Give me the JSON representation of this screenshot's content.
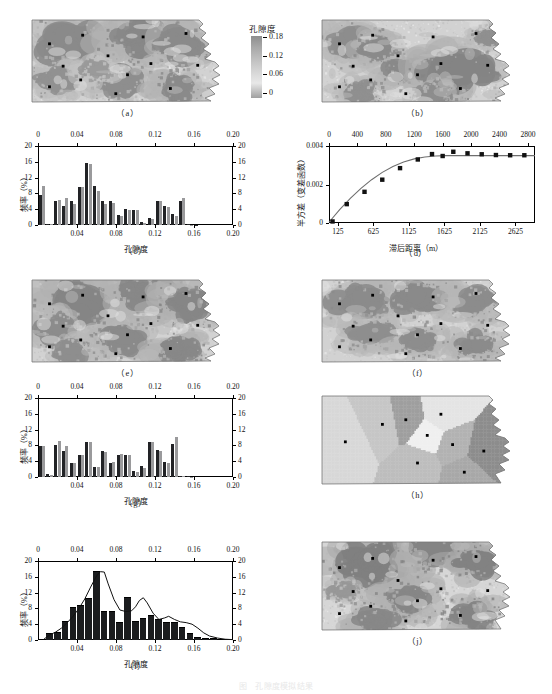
{
  "figure": {
    "caption": "图　孔隙度模拟结果",
    "colorbar": {
      "title": "孔隙度",
      "labels": [
        "0.18",
        "0.12",
        "0.06",
        "0"
      ],
      "values": [
        0.18,
        0.12,
        0.06,
        0
      ]
    },
    "panel_labels": {
      "a": "（a）",
      "b": "（b）",
      "c": "（c）",
      "d": "（d）",
      "e": "（e）",
      "f": "（f）",
      "g": "（g）",
      "h": "（h）",
      "i": "（i）",
      "j": "（j）"
    }
  },
  "chart_data": [
    {
      "id": "c",
      "type": "bar",
      "title": "（c）",
      "xlabel": "孔隙度",
      "ylabel": "频率（%）",
      "xlim": [
        0,
        0.2
      ],
      "ylim": [
        0,
        20
      ],
      "xticks_bottom": [
        "0.04",
        "0.08",
        "0.12",
        "0.16",
        "0.20"
      ],
      "xticks_top": [
        "0",
        "0.04",
        "0.08",
        "0.12",
        "0.16",
        "0.20"
      ],
      "yticks": [
        "0",
        "4",
        "8",
        "12",
        "16",
        "20"
      ],
      "grid": false,
      "legend": "none",
      "bin_width": 0.008,
      "categories": [
        0.004,
        0.012,
        0.02,
        0.028,
        0.036,
        0.044,
        0.052,
        0.06,
        0.068,
        0.076,
        0.084,
        0.092,
        0.1,
        0.108,
        0.116,
        0.124,
        0.132,
        0.14,
        0.148,
        0.156,
        0.164,
        0.172,
        0.18,
        0.188,
        0.196
      ],
      "series": [
        {
          "name": "模拟",
          "color": "#222326",
          "values": [
            7.6,
            0.3,
            6.2,
            4.7,
            6.0,
            9.5,
            15.8,
            9.8,
            6.0,
            6.0,
            2.6,
            4.0,
            3.9,
            0.8,
            1.8,
            6.0,
            4.7,
            2.9,
            6.0,
            0.2,
            0.1,
            0,
            0,
            0,
            0
          ]
        },
        {
          "name": "实测",
          "color": "#9a9a9c",
          "values": [
            10.0,
            0.2,
            6.3,
            6.8,
            5.2,
            9.6,
            15.5,
            8.5,
            5.4,
            5.6,
            2.4,
            3.8,
            3.8,
            0.6,
            1.5,
            6.2,
            4.6,
            2.4,
            6.9,
            0.1,
            0,
            0,
            0,
            0,
            0
          ]
        }
      ]
    },
    {
      "id": "d",
      "type": "line",
      "title": "（d）",
      "xlabel": "滞后距离（m）",
      "ylabel": "半方差（变差函数）",
      "xlim": [
        0,
        2900
      ],
      "ylim": [
        0,
        0.004
      ],
      "xticks_bottom": [
        "125",
        "625",
        "1125",
        "1625",
        "2125",
        "2625"
      ],
      "xticks_top": [
        "0",
        "400",
        "800",
        "1200",
        "1600",
        "2000",
        "2400",
        "2800"
      ],
      "yticks": [
        "0",
        "0.002",
        "0.004"
      ],
      "grid": false,
      "legend": "none",
      "points_x": [
        50,
        250,
        500,
        750,
        1000,
        1250,
        1450,
        1600,
        1750,
        1950,
        2150,
        2350,
        2550,
        2750
      ],
      "points_y": [
        8e-05,
        0.00098,
        0.00162,
        0.00225,
        0.00285,
        0.0033,
        0.00358,
        0.00348,
        0.0037,
        0.00362,
        0.00357,
        0.00353,
        0.00352,
        0.00352
      ],
      "model_name": "球状模型",
      "model_x": [
        0,
        150,
        300,
        450,
        600,
        750,
        900,
        1050,
        1200,
        1350,
        1500,
        1650,
        1800,
        2000,
        2200,
        2400,
        2600,
        2800,
        2900
      ],
      "model_y": [
        4e-05,
        0.0007,
        0.00128,
        0.0018,
        0.00225,
        0.00263,
        0.00294,
        0.00317,
        0.00333,
        0.00343,
        0.00348,
        0.0035,
        0.0035,
        0.0035,
        0.0035,
        0.0035,
        0.0035,
        0.0035,
        0.0035
      ]
    },
    {
      "id": "g",
      "type": "bar",
      "title": "（g）",
      "xlabel": "孔隙度",
      "ylabel": "频率（%）",
      "xlim": [
        0,
        0.2
      ],
      "ylim": [
        0,
        20
      ],
      "xticks_bottom": [
        "0.04",
        "0.08",
        "0.12",
        "0.16",
        "0.20"
      ],
      "xticks_top": [
        "0",
        "0.04",
        "0.08",
        "0.12",
        "0.16",
        "0.20"
      ],
      "yticks": [
        "0",
        "4",
        "8",
        "12",
        "16",
        "20"
      ],
      "grid": false,
      "legend": "none",
      "bin_width": 0.008,
      "categories": [
        0.004,
        0.012,
        0.02,
        0.028,
        0.036,
        0.044,
        0.052,
        0.06,
        0.068,
        0.076,
        0.084,
        0.092,
        0.1,
        0.108,
        0.116,
        0.124,
        0.132,
        0.14,
        0.148,
        0.156,
        0.164,
        0.172,
        0.18,
        0.188,
        0.196
      ],
      "series": [
        {
          "name": "模拟",
          "color": "#222326",
          "values": [
            7.8,
            0.7,
            8.0,
            6.7,
            3.6,
            5.5,
            8.9,
            2.6,
            6.5,
            3.6,
            5.7,
            5.5,
            1.5,
            2.8,
            8.8,
            6.8,
            3.9,
            8.3,
            0.3,
            0.2,
            0,
            0,
            0,
            0,
            0
          ]
        },
        {
          "name": "实测",
          "color": "#9a9a9c",
          "values": [
            7.8,
            0.6,
            9.2,
            7.8,
            3.5,
            5.6,
            8.9,
            2.5,
            6.3,
            3.7,
            5.8,
            5.5,
            1.2,
            2.2,
            8.9,
            6.6,
            3.5,
            10.2,
            0.2,
            0.1,
            0,
            0,
            0,
            0,
            0
          ]
        }
      ]
    },
    {
      "id": "i",
      "type": "bar",
      "title": "（i）",
      "xlabel": "孔隙度",
      "ylabel": "频率（%）",
      "xlim": [
        0,
        0.2
      ],
      "ylim": [
        0,
        20
      ],
      "xticks_bottom": [
        "0.04",
        "0.08",
        "0.12",
        "0.16",
        "0.20"
      ],
      "xticks_top": [
        "0",
        "0.04",
        "0.08",
        "0.12",
        "0.16",
        "0.20"
      ],
      "yticks": [
        "0",
        "4",
        "8",
        "12",
        "16",
        "20"
      ],
      "grid": false,
      "legend": "none",
      "bin_width": 0.008,
      "categories": [
        0.012,
        0.02,
        0.028,
        0.036,
        0.044,
        0.052,
        0.06,
        0.068,
        0.076,
        0.084,
        0.092,
        0.1,
        0.108,
        0.116,
        0.124,
        0.132,
        0.14,
        0.148,
        0.156,
        0.164,
        0.172,
        0.18,
        0.188,
        0.196
      ],
      "series": [
        {
          "name": "频率",
          "color": "#1b1c1e",
          "values": [
            1.5,
            1.9,
            4.6,
            8.2,
            8.5,
            10.4,
            17.2,
            7.2,
            7.1,
            4.3,
            10.7,
            4.6,
            5.2,
            6.0,
            5.0,
            4.4,
            4.4,
            3.1,
            1.4,
            0.6,
            0.3,
            0.2,
            0,
            0
          ]
        }
      ],
      "density_curve": {
        "name": "拟合密度曲线",
        "x": [
          0.006,
          0.012,
          0.018,
          0.024,
          0.03,
          0.036,
          0.042,
          0.048,
          0.054,
          0.06,
          0.064,
          0.068,
          0.072,
          0.078,
          0.084,
          0.09,
          0.096,
          0.1,
          0.104,
          0.108,
          0.112,
          0.118,
          0.124,
          0.13,
          0.134,
          0.14,
          0.146,
          0.152,
          0.158,
          0.164,
          0.17,
          0.176,
          0.184,
          0.192,
          0.2
        ],
        "y": [
          0.2,
          1.3,
          2.0,
          3.0,
          4.4,
          6.0,
          8.0,
          10.4,
          13.4,
          16.2,
          17.3,
          17.2,
          14.2,
          10.2,
          7.6,
          7.2,
          7.4,
          8.4,
          10.0,
          10.7,
          9.4,
          6.8,
          5.2,
          5.6,
          6.0,
          5.2,
          4.6,
          4.4,
          4.0,
          3.0,
          1.8,
          1.0,
          0.5,
          0.2,
          0.1
        ]
      }
    }
  ],
  "maps": [
    {
      "id": "a",
      "label": "（a）",
      "kind": "porosity-realization",
      "points": 13
    },
    {
      "id": "b",
      "label": "（b）",
      "kind": "porosity-realization",
      "points": 13
    },
    {
      "id": "e",
      "label": "（e）",
      "kind": "porosity-realization",
      "points": 13
    },
    {
      "id": "f",
      "label": "（f）",
      "kind": "porosity-realization",
      "points": 13
    },
    {
      "id": "h",
      "label": "（h）",
      "kind": "voronoi-thiessen",
      "points": 9
    },
    {
      "id": "j",
      "label": "（j）",
      "kind": "porosity-realization",
      "points": 13
    }
  ]
}
